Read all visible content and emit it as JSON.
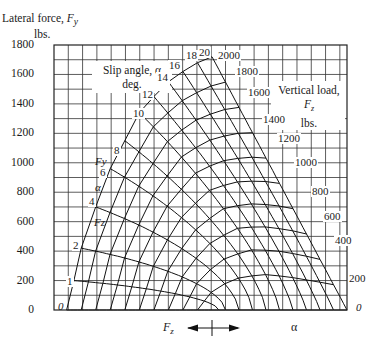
{
  "chart_data": {
    "type": "line",
    "title": "",
    "ylabel": "Lateral force, Fy lbs.",
    "ylabel_line1": "Lateral force, ",
    "ylabel_symbol": "F",
    "ylabel_symbol_sub": "y",
    "ylabel_line2": "lbs.",
    "ylim": [
      0,
      1800
    ],
    "yticks": [
      0,
      200,
      400,
      600,
      800,
      1000,
      1200,
      1400,
      1600,
      1800
    ],
    "grid": true,
    "grid_minor_step": 100,
    "xaxis_legend": {
      "left_label": "Fz",
      "right_label": "α"
    },
    "annotations": {
      "slip_angle_box": [
        "Slip angle, α",
        "deg."
      ],
      "vertical_load_box": [
        "Vertical load, Fz",
        "lbs."
      ],
      "inline_axis_labels": [
        "Fy",
        "α",
        "Fz"
      ]
    },
    "slip_angle_series_deg": [
      0,
      1,
      2,
      4,
      6,
      8,
      10,
      12,
      14,
      16,
      18,
      20
    ],
    "vertical_load_series_lbs": [
      200,
      400,
      600,
      800,
      1000,
      1200,
      1400,
      1600,
      1800,
      2000
    ],
    "slip_angle_envelope_at_2000lbs": [
      {
        "alpha": 0,
        "Fy": 0
      },
      {
        "alpha": 1,
        "Fy": 200
      },
      {
        "alpha": 2,
        "Fy": 420
      },
      {
        "alpha": 4,
        "Fy": 700
      },
      {
        "alpha": 6,
        "Fy": 960
      },
      {
        "alpha": 8,
        "Fy": 1150
      },
      {
        "alpha": 10,
        "Fy": 1340
      },
      {
        "alpha": 12,
        "Fy": 1450
      },
      {
        "alpha": 14,
        "Fy": 1550
      },
      {
        "alpha": 16,
        "Fy": 1620
      },
      {
        "alpha": 18,
        "Fy": 1680
      },
      {
        "alpha": 20,
        "Fy": 1720
      }
    ],
    "load_envelope_at_20deg": [
      {
        "Fz": 2000,
        "Fy": 1720
      },
      {
        "Fz": 1800,
        "Fy": 1600
      },
      {
        "Fz": 1600,
        "Fy": 1430
      },
      {
        "Fz": 1400,
        "Fy": 1270
      },
      {
        "Fz": 1200,
        "Fy": 1100
      },
      {
        "Fz": 1000,
        "Fy": 960
      },
      {
        "Fz": 800,
        "Fy": 800
      },
      {
        "Fz": 600,
        "Fy": 600
      },
      {
        "Fz": 400,
        "Fy": 420
      },
      {
        "Fz": 200,
        "Fy": 200
      },
      {
        "Fz": 0,
        "Fy": 0
      }
    ]
  },
  "labels": {
    "ytick_labels": [
      "0",
      "200",
      "400",
      "600",
      "800",
      "1000",
      "1200",
      "1400",
      "1600",
      "1800"
    ],
    "slip_box_line1": "Slip angle, α",
    "slip_box_line2": "deg.",
    "load_box_line1": "Vertical load, ",
    "load_box_sym": "F",
    "load_box_sub": "z",
    "load_box_line2": "lbs.",
    "legend_fz": "F",
    "legend_fz_sub": "z",
    "legend_alpha": "α"
  }
}
